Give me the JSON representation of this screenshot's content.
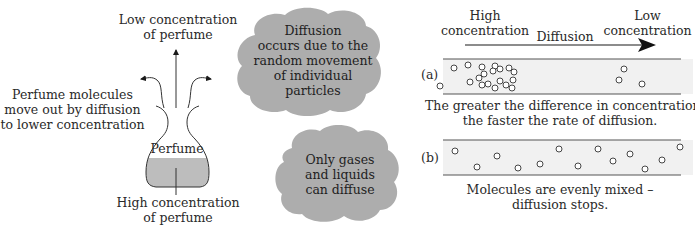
{
  "left_panel": {
    "top_label": [
      "Low concentration",
      "of perfume"
    ],
    "side_label": [
      "Perfume molecules",
      "move out by diffusion",
      "to lower concentration"
    ],
    "flask_label": "Perfume",
    "bottom_label": [
      "High concentration",
      "of perfume"
    ],
    "liquid_color": "#bdbdbd"
  },
  "clouds": [
    {
      "lines": [
        "Diffusion",
        "occurs due to the",
        "random movement",
        "of individual",
        "particles"
      ],
      "color": "#adadad"
    },
    {
      "lines": [
        "Only gases",
        "and liquids",
        "can diffuse"
      ],
      "color": "#adadad"
    }
  ],
  "right_panel": {
    "high_label": [
      "High",
      "concentration"
    ],
    "low_label": [
      "Low",
      "concentration"
    ],
    "arrow_label": "Diffusion",
    "tube_a": {
      "label": "(a)",
      "caption": [
        "The greater the difference in concentration,",
        "the faster the rate of diffusion."
      ],
      "molecules": [
        [
          440,
          86
        ],
        [
          454,
          68
        ],
        [
          468,
          65
        ],
        [
          482,
          67
        ],
        [
          495,
          66
        ],
        [
          484,
          74
        ],
        [
          493,
          71
        ],
        [
          500,
          69
        ],
        [
          509,
          68
        ],
        [
          514,
          72
        ],
        [
          479,
          78
        ],
        [
          470,
          82
        ],
        [
          488,
          84
        ],
        [
          500,
          81
        ],
        [
          506,
          85
        ],
        [
          513,
          80
        ],
        [
          512,
          88
        ],
        [
          495,
          88
        ],
        [
          482,
          85
        ],
        [
          624,
          69
        ],
        [
          619,
          80
        ],
        [
          642,
          84
        ]
      ]
    },
    "tube_b": {
      "label": "(b)",
      "caption": [
        "Molecules are evenly mixed –",
        "diffusion stops."
      ],
      "molecules": [
        [
          455,
          151
        ],
        [
          477,
          167
        ],
        [
          497,
          156
        ],
        [
          518,
          168
        ],
        [
          540,
          164
        ],
        [
          559,
          149
        ],
        [
          578,
          166
        ],
        [
          598,
          149
        ],
        [
          613,
          161
        ],
        [
          630,
          154
        ],
        [
          645,
          169
        ],
        [
          662,
          160
        ],
        [
          680,
          147
        ]
      ]
    },
    "tube_fill": "#f1f1f1"
  }
}
